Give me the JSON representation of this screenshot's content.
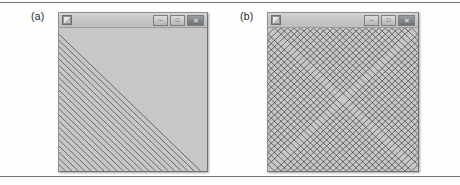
{
  "figure": {
    "background_color": "#fefefe",
    "rule_color": "#6e7376",
    "panels": [
      {
        "label": "(a)",
        "window": {
          "icon_name": "app-icon",
          "title": "",
          "client_bg": "#c8c8c8",
          "titlebar_bg": "#c6c6c6",
          "line_color": "#1b1b1b",
          "buttons": [
            {
              "name": "minimize-button",
              "glyph": "–"
            },
            {
              "name": "maximize-button",
              "glyph": "□"
            },
            {
              "name": "close-button",
              "glyph": "✕"
            }
          ]
        },
        "art": {
          "pattern": "string-art-parabola",
          "corners": 1,
          "line_count": 22,
          "description": "Straight chords joining the left edge to the bottom edge, enveloping a hyperbola-like curve in the lower-left quadrant."
        }
      },
      {
        "label": "(b)",
        "window": {
          "icon_name": "app-icon",
          "title": "",
          "client_bg": "#c8c8c8",
          "titlebar_bg": "#c6c6c6",
          "line_color": "#1b1b1b",
          "buttons": [
            {
              "name": "minimize-button",
              "glyph": "–"
            },
            {
              "name": "maximize-button",
              "glyph": "□"
            },
            {
              "name": "close-button",
              "glyph": "✕"
            }
          ]
        },
        "art": {
          "pattern": "string-art-astroid",
          "corners": 4,
          "line_count": 22,
          "description": "The same chord family repeated in all four corners, the four envelopes meeting to outline a rounded diamond (astroid) in the centre."
        }
      }
    ]
  }
}
